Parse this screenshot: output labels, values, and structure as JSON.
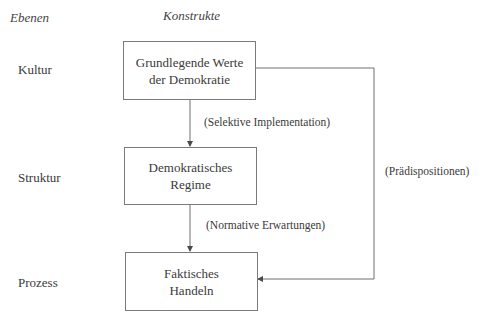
{
  "headers": {
    "levels": "Ebenen",
    "constructs": "Konstrukte"
  },
  "levels": [
    {
      "label": "Kultur"
    },
    {
      "label": "Struktur"
    },
    {
      "label": "Prozess"
    }
  ],
  "boxes": [
    {
      "line1": "Grundlegende Werte",
      "line2": "der Demokratie"
    },
    {
      "line1": "Demokratisches",
      "line2": "Regime"
    },
    {
      "line1": "Faktisches",
      "line2": "Handeln"
    }
  ],
  "edges": [
    {
      "from": "Grundlegende Werte der Demokratie",
      "to": "Demokratisches Regime",
      "label": "(Selektive Implementation)"
    },
    {
      "from": "Demokratisches Regime",
      "to": "Faktisches Handeln",
      "label": "(Normative Erwartungen)"
    },
    {
      "from": "Grundlegende Werte der Demokratie",
      "to": "Faktisches Handeln",
      "label": "(Prädispositionen)"
    }
  ],
  "colors": {
    "line": "#6e6e6e",
    "text": "#3a3a3a",
    "background": "#ffffff"
  }
}
